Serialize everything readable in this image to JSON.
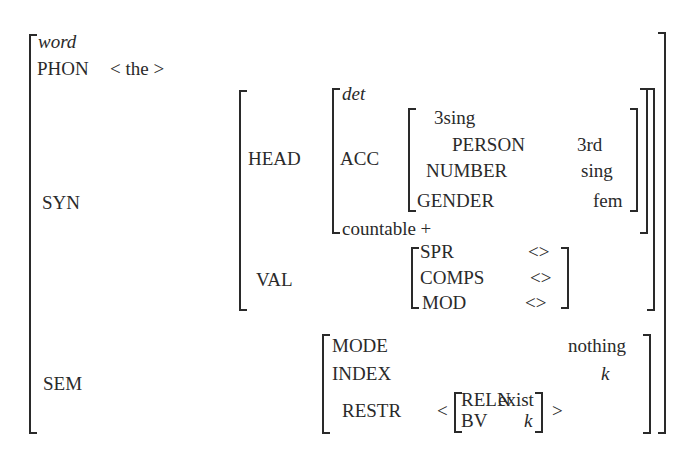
{
  "avm": {
    "type": "word",
    "phon": {
      "label": "PHON",
      "value": "< the >"
    },
    "syn": {
      "label": "SYN",
      "head": {
        "label": "HEAD",
        "type": "det",
        "acc": {
          "label": "ACC",
          "type": "3sing",
          "features": [
            {
              "label": "PERSON",
              "value": "3rd"
            },
            {
              "label": "NUMBER",
              "value": "sing"
            },
            {
              "label": "GENDER",
              "value": "fem"
            }
          ]
        },
        "countable": "countable +"
      },
      "val": {
        "label": "VAL",
        "features": [
          {
            "label": "SPR",
            "value": "<>"
          },
          {
            "label": "COMPS",
            "value": "<>"
          },
          {
            "label": "MOD",
            "value": "<>"
          }
        ]
      }
    },
    "sem": {
      "label": "SEM",
      "mode": {
        "label": "MODE",
        "value": "nothing"
      },
      "index": {
        "label": "INDEX",
        "value": "k"
      },
      "restr": {
        "label": "RESTR",
        "open": "<",
        "close": ">",
        "reln": {
          "label": "RELN",
          "value": "exist"
        },
        "bv": {
          "label": "BV",
          "value": "k"
        }
      }
    }
  }
}
